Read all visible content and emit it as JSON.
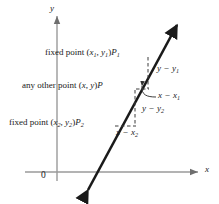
{
  "figure": {
    "type": "diagram",
    "axes": {
      "y_label": "y",
      "x_label": "x",
      "origin_label": "0"
    },
    "points": [
      {
        "id": "P1",
        "label": "fixed point (x₁, y₁)P₁",
        "text_parts": {
          "prefix": "fixed point ",
          "coords_open": "(",
          "x": "x",
          "x_sub": "1",
          "comma": ", ",
          "y": "y",
          "y_sub": "1",
          "coords_close": ")",
          "point_name": "P",
          "point_sub": "1"
        }
      },
      {
        "id": "P",
        "label": "any other point (x, y)P",
        "text_parts": {
          "prefix": "any other point ",
          "coords_open": "(",
          "x": "x",
          "x_sub": "",
          "comma": ", ",
          "y": "y",
          "y_sub": "",
          "coords_close": ")",
          "point_name": "P",
          "point_sub": ""
        }
      },
      {
        "id": "P2",
        "label": "fixed point (x₂, y₂)P₂",
        "text_parts": {
          "prefix": "fixed point ",
          "coords_open": "(",
          "x": "x",
          "x_sub": "2",
          "comma": ", ",
          "y": "y",
          "y_sub": "2",
          "coords_close": ")",
          "point_name": "P",
          "point_sub": "2"
        }
      }
    ],
    "annotations": [
      {
        "id": "dy1",
        "label": "y − y₁",
        "lead": "y",
        "lead_sub": "",
        "op": " − ",
        "tail": "y",
        "tail_sub": "1"
      },
      {
        "id": "dx1",
        "label": "x − x₁",
        "lead": "x",
        "lead_sub": "",
        "op": " − ",
        "tail": "x",
        "tail_sub": "1"
      },
      {
        "id": "dy2",
        "label": "y − y₂",
        "lead": "y",
        "lead_sub": "",
        "op": " − ",
        "tail": "y",
        "tail_sub": "2"
      },
      {
        "id": "dx2",
        "label": "x − x₂",
        "lead": "x",
        "lead_sub": "",
        "op": " − ",
        "tail": "x",
        "tail_sub": "2"
      }
    ],
    "colors": {
      "line": "#1a1a1a",
      "axis": "#808080",
      "dashed": "#555555",
      "text": "#1a1a1a",
      "background": "#ffffff"
    }
  }
}
